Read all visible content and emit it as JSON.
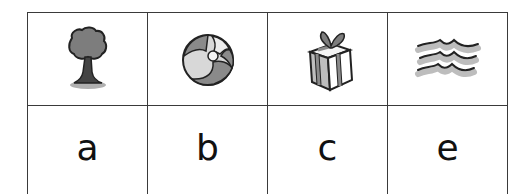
{
  "worksheet": {
    "cells": [
      {
        "picture": "tree-icon",
        "picture_label": "tree",
        "letter": "a"
      },
      {
        "picture": "beach-ball-icon",
        "picture_label": "ball",
        "letter": "b"
      },
      {
        "picture": "gift-box-icon",
        "picture_label": "gift",
        "letter": "c"
      },
      {
        "picture": "waves-icon",
        "picture_label": "waves",
        "letter": "e"
      }
    ]
  },
  "colors": {
    "border": "#3a3a3a",
    "ink": "#222222",
    "fill_dark": "#8a8a8a",
    "fill_light": "#c8c8c8",
    "background": "#ffffff"
  }
}
